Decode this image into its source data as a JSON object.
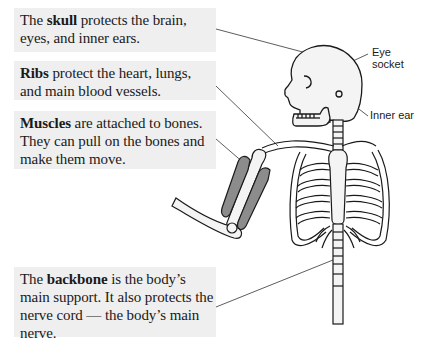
{
  "callouts": {
    "skull": {
      "bold": "skull",
      "before": "The ",
      "after": " protects the brain, eyes, and inner ears."
    },
    "ribs": {
      "bold": "Ribs",
      "before": "",
      "after": " protect the heart, lungs, and main blood vessels."
    },
    "muscles": {
      "bold": "Muscles",
      "before": "",
      "after": " are attached to bones. They can pull on the bones and make them move."
    },
    "backbone": {
      "bold": "backbone",
      "before": "The ",
      "after": " is the body’s main support. It also protects the nerve cord — the body’s main nerve."
    }
  },
  "labels": {
    "eye_line1": "Eye",
    "eye_line2": "socket",
    "inner_ear": "Inner ear"
  },
  "colors": {
    "callout_bg": "#efefef",
    "muscle_fill": "#8c8c8c",
    "bone_fill": "#f4f4f4",
    "outline": "#1a1a1a"
  }
}
